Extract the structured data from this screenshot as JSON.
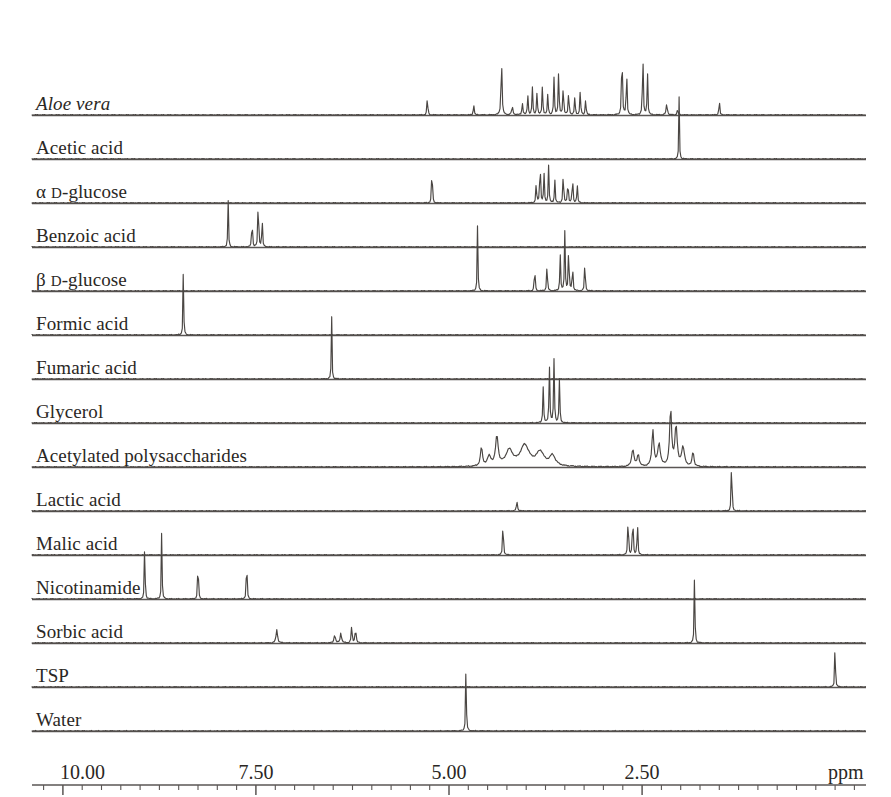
{
  "figure": {
    "type": "nmr-stack-plot",
    "background": "#ffffff",
    "trace_color": "#4a4643",
    "baseline_color": "#5a5654"
  },
  "axis": {
    "unit_label": "ppm",
    "tick_labels": [
      "10.00",
      "7.50",
      "5.00",
      "2.50"
    ],
    "tick_values": [
      10.0,
      7.5,
      5.0,
      2.5
    ],
    "minor_tick_step": 0.25,
    "range_left_ppm": 10.4,
    "range_right_ppm": -0.4
  },
  "traces": [
    {
      "label": "Aloe vera",
      "italic": true
    },
    {
      "label": "Acetic acid",
      "italic": false
    },
    {
      "label_prefix": "α",
      "label_smallcap": "D",
      "label_rest": "-glucose",
      "italic": false
    },
    {
      "label": "Benzoic acid",
      "italic": false
    },
    {
      "label_prefix": "β",
      "label_smallcap": "D",
      "label_rest": "-glucose",
      "italic": false
    },
    {
      "label": "Formic acid",
      "italic": false
    },
    {
      "label": "Fumaric acid",
      "italic": false
    },
    {
      "label": "Glycerol",
      "italic": false
    },
    {
      "label": "Acetylated polysaccharides",
      "italic": false
    },
    {
      "label": "Lactic acid",
      "italic": false
    },
    {
      "label": "Malic acid",
      "italic": false
    },
    {
      "label": "Nicotinamide",
      "italic": false
    },
    {
      "label": "Sorbic acid",
      "italic": false
    },
    {
      "label": "TSP",
      "italic": false
    },
    {
      "label": "Water",
      "italic": false
    }
  ],
  "chart_data": {
    "type": "line",
    "title": "",
    "xlabel": "ppm",
    "ylabel": "",
    "xlim": [
      10.4,
      -0.4
    ],
    "x_inverted": true,
    "grid": false,
    "legend": "none",
    "axis_ticks_major": [
      10.0,
      7.5,
      5.0,
      2.5
    ],
    "axis_ticks_minor_step": 0.25,
    "series": [
      {
        "name": "Aloe vera",
        "peaks": [
          {
            "ppm": 5.28,
            "height": 0.22,
            "width": 0.012
          },
          {
            "ppm": 4.68,
            "height": 0.13,
            "width": 0.012
          },
          {
            "ppm": 4.32,
            "height": 0.7,
            "width": 0.014
          },
          {
            "ppm": 4.18,
            "height": 0.09,
            "width": 0.02
          },
          {
            "ppm": 4.05,
            "height": 0.14,
            "width": 0.014
          },
          {
            "ppm": 3.98,
            "height": 0.24,
            "width": 0.012
          },
          {
            "ppm": 3.92,
            "height": 0.32,
            "width": 0.012
          },
          {
            "ppm": 3.86,
            "height": 0.27,
            "width": 0.012
          },
          {
            "ppm": 3.79,
            "height": 0.35,
            "width": 0.012
          },
          {
            "ppm": 3.72,
            "height": 0.25,
            "width": 0.012
          },
          {
            "ppm": 3.64,
            "height": 0.43,
            "width": 0.012
          },
          {
            "ppm": 3.58,
            "height": 0.52,
            "width": 0.012
          },
          {
            "ppm": 3.52,
            "height": 0.38,
            "width": 0.012
          },
          {
            "ppm": 3.45,
            "height": 0.3,
            "width": 0.012
          },
          {
            "ppm": 3.37,
            "height": 0.22,
            "width": 0.012
          },
          {
            "ppm": 3.3,
            "height": 0.29,
            "width": 0.012
          },
          {
            "ppm": 3.23,
            "height": 0.19,
            "width": 0.012
          },
          {
            "ppm": 2.76,
            "height": 0.96,
            "width": 0.011
          },
          {
            "ppm": 2.7,
            "height": 0.6,
            "width": 0.011
          },
          {
            "ppm": 2.49,
            "height": 0.82,
            "width": 0.011
          },
          {
            "ppm": 2.43,
            "height": 0.52,
            "width": 0.011
          },
          {
            "ppm": 2.18,
            "height": 0.13,
            "width": 0.018
          },
          {
            "ppm": 2.04,
            "height": 0.06,
            "width": 0.016
          },
          {
            "ppm": 1.5,
            "height": 0.22,
            "width": 0.01
          }
        ]
      },
      {
        "name": "Acetic acid",
        "peaks": [
          {
            "ppm": 2.02,
            "height": 0.72,
            "width": 0.009
          }
        ]
      },
      {
        "name": "α D-glucose",
        "peaks": [
          {
            "ppm": 5.22,
            "height": 0.55,
            "width": 0.01
          },
          {
            "ppm": 3.87,
            "height": 0.26,
            "width": 0.011
          },
          {
            "ppm": 3.82,
            "height": 0.58,
            "width": 0.011
          },
          {
            "ppm": 3.77,
            "height": 0.36,
            "width": 0.011
          },
          {
            "ppm": 3.71,
            "height": 0.44,
            "width": 0.011
          },
          {
            "ppm": 3.63,
            "height": 0.28,
            "width": 0.011
          },
          {
            "ppm": 3.52,
            "height": 0.4,
            "width": 0.011
          },
          {
            "ppm": 3.46,
            "height": 0.32,
            "width": 0.011
          },
          {
            "ppm": 3.4,
            "height": 0.35,
            "width": 0.011
          },
          {
            "ppm": 3.34,
            "height": 0.24,
            "width": 0.011
          }
        ]
      },
      {
        "name": "Benzoic acid",
        "peaks": [
          {
            "ppm": 7.86,
            "height": 0.55,
            "width": 0.01
          },
          {
            "ppm": 7.55,
            "height": 0.42,
            "width": 0.01
          },
          {
            "ppm": 7.47,
            "height": 0.74,
            "width": 0.01
          },
          {
            "ppm": 7.42,
            "height": 0.4,
            "width": 0.01
          }
        ]
      },
      {
        "name": "β D-glucose",
        "peaks": [
          {
            "ppm": 4.63,
            "height": 0.78,
            "width": 0.01
          },
          {
            "ppm": 3.89,
            "height": 0.32,
            "width": 0.011
          },
          {
            "ppm": 3.73,
            "height": 0.36,
            "width": 0.011
          },
          {
            "ppm": 3.56,
            "height": 0.44,
            "width": 0.011
          },
          {
            "ppm": 3.5,
            "height": 0.7,
            "width": 0.011
          },
          {
            "ppm": 3.45,
            "height": 0.58,
            "width": 0.011
          },
          {
            "ppm": 3.4,
            "height": 0.35,
            "width": 0.011
          },
          {
            "ppm": 3.24,
            "height": 0.4,
            "width": 0.011
          }
        ]
      },
      {
        "name": "Formic acid",
        "peaks": [
          {
            "ppm": 8.44,
            "height": 0.84,
            "width": 0.009
          }
        ]
      },
      {
        "name": "Fumaric acid",
        "peaks": [
          {
            "ppm": 6.52,
            "height": 0.76,
            "width": 0.009
          }
        ]
      },
      {
        "name": "Glycerol",
        "peaks": [
          {
            "ppm": 3.78,
            "height": 0.42,
            "width": 0.012
          },
          {
            "ppm": 3.7,
            "height": 0.68,
            "width": 0.012
          },
          {
            "ppm": 3.64,
            "height": 0.74,
            "width": 0.012
          },
          {
            "ppm": 3.57,
            "height": 0.5,
            "width": 0.012
          }
        ]
      },
      {
        "name": "Acetylated polysaccharides",
        "broad": true,
        "peaks": [
          {
            "ppm": 4.58,
            "height": 0.22,
            "width": 0.03
          },
          {
            "ppm": 4.48,
            "height": 0.11,
            "width": 0.055
          },
          {
            "ppm": 4.38,
            "height": 0.34,
            "width": 0.04
          },
          {
            "ppm": 4.22,
            "height": 0.18,
            "width": 0.11
          },
          {
            "ppm": 4.02,
            "height": 0.24,
            "width": 0.14
          },
          {
            "ppm": 3.82,
            "height": 0.16,
            "width": 0.12
          },
          {
            "ppm": 3.66,
            "height": 0.12,
            "width": 0.09
          },
          {
            "ppm": 2.62,
            "height": 0.2,
            "width": 0.035
          },
          {
            "ppm": 2.55,
            "height": 0.14,
            "width": 0.03
          },
          {
            "ppm": 2.36,
            "height": 0.42,
            "width": 0.03
          },
          {
            "ppm": 2.28,
            "height": 0.26,
            "width": 0.04
          },
          {
            "ppm": 2.13,
            "height": 0.66,
            "width": 0.03
          },
          {
            "ppm": 2.06,
            "height": 0.46,
            "width": 0.035
          },
          {
            "ppm": 1.97,
            "height": 0.22,
            "width": 0.045
          },
          {
            "ppm": 1.84,
            "height": 0.18,
            "width": 0.025
          }
        ]
      },
      {
        "name": "Lactic acid",
        "peaks": [
          {
            "ppm": 4.12,
            "height": 0.11,
            "width": 0.016
          },
          {
            "ppm": 1.34,
            "height": 0.86,
            "width": 0.009
          }
        ]
      },
      {
        "name": "Malic acid",
        "peaks": [
          {
            "ppm": 4.3,
            "height": 0.52,
            "width": 0.01
          },
          {
            "ppm": 2.68,
            "height": 0.6,
            "width": 0.01
          },
          {
            "ppm": 2.62,
            "height": 0.62,
            "width": 0.01
          },
          {
            "ppm": 2.56,
            "height": 0.48,
            "width": 0.01
          }
        ]
      },
      {
        "name": "Nicotinamide",
        "peaks": [
          {
            "ppm": 8.94,
            "height": 0.82,
            "width": 0.009
          },
          {
            "ppm": 8.72,
            "height": 0.88,
            "width": 0.009
          },
          {
            "ppm": 8.25,
            "height": 0.66,
            "width": 0.009
          },
          {
            "ppm": 7.62,
            "height": 0.68,
            "width": 0.009
          }
        ]
      },
      {
        "name": "Sorbic acid",
        "peaks": [
          {
            "ppm": 7.23,
            "height": 0.16,
            "width": 0.022
          },
          {
            "ppm": 6.48,
            "height": 0.1,
            "width": 0.02
          },
          {
            "ppm": 6.4,
            "height": 0.12,
            "width": 0.02
          },
          {
            "ppm": 6.26,
            "height": 0.2,
            "width": 0.014
          },
          {
            "ppm": 6.21,
            "height": 0.19,
            "width": 0.014
          },
          {
            "ppm": 1.82,
            "height": 0.86,
            "width": 0.01
          }
        ]
      },
      {
        "name": "TSP",
        "peaks": [
          {
            "ppm": 0.0,
            "height": 0.8,
            "width": 0.008
          }
        ]
      },
      {
        "name": "Water",
        "peaks": [
          {
            "ppm": 4.78,
            "height": 0.82,
            "width": 0.01
          }
        ]
      }
    ]
  }
}
